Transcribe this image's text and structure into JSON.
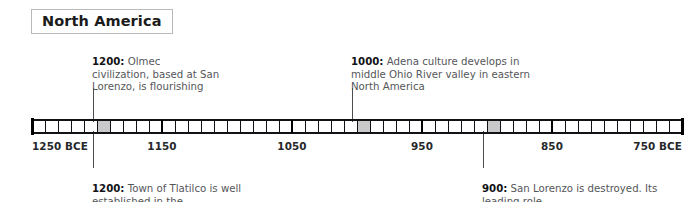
{
  "region": {
    "label": "North America"
  },
  "axis": {
    "start_year": 1250,
    "end_year": 750,
    "era": "BCE",
    "minor_step": 10,
    "major_step": 100,
    "left_label": "1250 BCE",
    "right_label": "750 BCE",
    "tick_labels": [
      {
        "year": 1250,
        "text": "1250 BCE",
        "align": "left"
      },
      {
        "year": 1150,
        "text": "1150",
        "align": "center"
      },
      {
        "year": 1050,
        "text": "1050",
        "align": "center"
      },
      {
        "year": 950,
        "text": "950",
        "align": "center"
      },
      {
        "year": 850,
        "text": "850",
        "align": "center"
      },
      {
        "year": 750,
        "text": "750 BCE",
        "align": "right"
      }
    ]
  },
  "markers": [
    {
      "year": 1200,
      "highlight": true
    },
    {
      "year": 1000,
      "highlight": true
    },
    {
      "year": 900,
      "highlight": true
    }
  ],
  "events": [
    {
      "id": "olmec",
      "year": "1200",
      "text": " Olmec civilization, based at San Lorenzo, is flourishing",
      "position": "above",
      "anchor_year": 1200
    },
    {
      "id": "adena",
      "year": "1000",
      "text": " Adena culture develops in middle Ohio River valley in eastern North America",
      "position": "above",
      "anchor_year": 1000
    },
    {
      "id": "tlatilco",
      "year": "1200",
      "text": " Town of Tlatilco is well established in the",
      "position": "below",
      "anchor_year": 1200
    },
    {
      "id": "san-lorenzo-destroyed",
      "year": "900",
      "text": " San Lorenzo is destroyed. Its leading role",
      "position": "below",
      "anchor_year": 900
    }
  ],
  "colors": {
    "ink": "#111215",
    "body_text": "#55565a",
    "highlight_cell": "#c9c9c9",
    "box_border": "#b9b9b9",
    "background": "#ffffff"
  }
}
